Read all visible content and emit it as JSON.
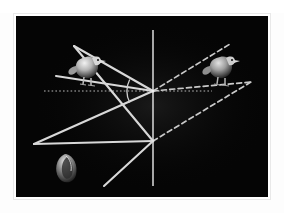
{
  "figure": {
    "panel_background": "#050505",
    "border_color": "#e9e9e9",
    "page_background": "#ffffff",
    "panel": {
      "x": 16,
      "y": 16,
      "width": 252,
      "height": 181
    }
  },
  "palette": {
    "ray_solid": "#d8d8d8",
    "ray_dashed": "#c9c9c9",
    "axis_vertical": "#d0d0d0",
    "axis_horizontal_dotted": "#b8b8b8",
    "arc": "#cfcfcf",
    "object_body": "#bdbdbd",
    "object_shadow": "#3a3a3a"
  },
  "geometry": {
    "convergence_point_primary": {
      "x": 137,
      "y": 75
    },
    "convergence_point_secondary": {
      "x": 137,
      "y": 125
    },
    "mirror_axis": {
      "x": 137,
      "y_top": 14,
      "y_bottom": 170
    },
    "optical_axis_y": 75,
    "angle_arc": {
      "cx": 137,
      "cy": 75,
      "radius": 26
    }
  },
  "elements": {
    "mirror_axis_label": "mirror axis",
    "optical_axis_label": "optical axis",
    "angle_label": "incidence angle",
    "object_left_label": "real object bird",
    "object_right_label": "virtual image bird",
    "object_bottom_label": "shell object"
  },
  "rays": {
    "solid": [
      {
        "name": "ray-upper-left-incident",
        "x1": 40,
        "y1": 60,
        "x2": 137,
        "y2": 75
      },
      {
        "name": "ray-upper-left-outgoing",
        "x1": 58,
        "y1": 30,
        "x2": 137,
        "y2": 75
      },
      {
        "name": "ray-lower-left-long",
        "x1": 18,
        "y1": 128,
        "x2": 137,
        "y2": 75
      },
      {
        "name": "ray-lower-left-cross",
        "x1": 58,
        "y1": 30,
        "x2": 137,
        "y2": 125
      },
      {
        "name": "ray-bottom-diagonal",
        "x1": 18,
        "y1": 128,
        "x2": 137,
        "y2": 125
      },
      {
        "name": "ray-bottom-extension",
        "x1": 88,
        "y1": 170,
        "x2": 137,
        "y2": 125
      }
    ],
    "dashed": [
      {
        "name": "ray-virtual-upper",
        "x1": 137,
        "y1": 75,
        "x2": 214,
        "y2": 28
      },
      {
        "name": "ray-virtual-mid",
        "x1": 137,
        "y1": 75,
        "x2": 235,
        "y2": 66
      },
      {
        "name": "ray-virtual-lower",
        "x1": 137,
        "y1": 125,
        "x2": 235,
        "y2": 66
      }
    ],
    "dotted_horizontal": {
      "name": "optical-axis",
      "x1": 28,
      "y1": 75,
      "x2": 196,
      "y2": 75
    }
  },
  "objects": [
    {
      "name": "bird-left",
      "cx": 72,
      "cy": 52,
      "facing": "left",
      "style": "solid-real"
    },
    {
      "name": "bird-right",
      "cx": 206,
      "cy": 52,
      "facing": "left",
      "style": "virtual-image"
    },
    {
      "name": "shell-lower",
      "cx": 50,
      "cy": 152,
      "facing": "up",
      "style": "solid-real"
    }
  ]
}
